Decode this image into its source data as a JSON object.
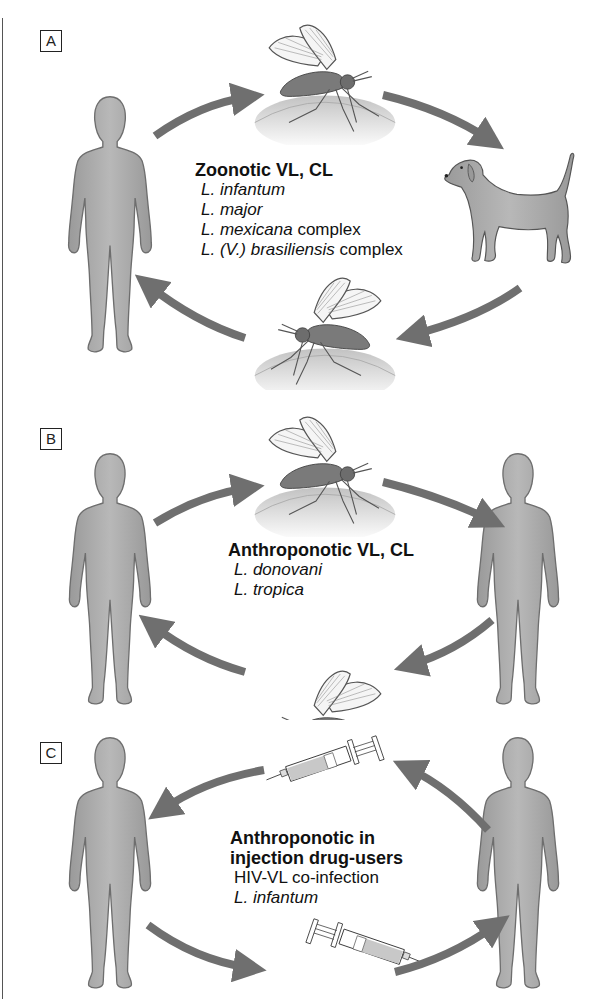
{
  "panels": [
    {
      "label": "A",
      "title": "Zoonotic VL, CL",
      "species": [
        {
          "italic": "L. infantum",
          "suffix": ""
        },
        {
          "italic": "L. major",
          "suffix": ""
        },
        {
          "italic": "L. mexicana",
          "suffix": " complex"
        },
        {
          "italic": "L. (V.) brasiliensis",
          "suffix": " complex"
        }
      ],
      "hosts": [
        "human",
        "dog"
      ],
      "vectors": [
        "sandfly",
        "sandfly"
      ]
    },
    {
      "label": "B",
      "title": "Anthroponotic VL, CL",
      "species": [
        {
          "italic": "L. donovani",
          "suffix": ""
        },
        {
          "italic": "L. tropica",
          "suffix": ""
        }
      ],
      "hosts": [
        "human",
        "human"
      ],
      "vectors": [
        "sandfly",
        "sandfly"
      ]
    },
    {
      "label": "C",
      "title_line1": "Anthroponotic in",
      "title_line2": "injection drug-users",
      "subtitle": "HIV-VL co-infection",
      "species": [
        {
          "italic": "L. infantum",
          "suffix": ""
        }
      ],
      "hosts": [
        "human",
        "human"
      ],
      "vectors": [
        "syringe",
        "syringe"
      ]
    }
  ],
  "colors": {
    "figure_fill": "#a9a9a9",
    "figure_stroke": "#6e6e6e",
    "arrow": "#6f6f6f",
    "text": "#111111"
  }
}
